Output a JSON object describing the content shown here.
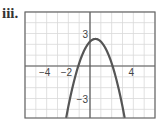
{
  "problem_label": "iii.",
  "chart_data": {
    "type": "line",
    "title": "",
    "xlabel": "",
    "ylabel": "",
    "xlim": [
      -6,
      6
    ],
    "ylim": [
      -4.8,
      5
    ],
    "grid": true,
    "grid_step": 1,
    "x_tick_labels": [
      {
        "value": -4,
        "label": "−4"
      },
      {
        "value": -2,
        "label": "−2"
      },
      {
        "value": 4,
        "label": "4"
      }
    ],
    "y_tick_labels": [
      {
        "value": 3,
        "label": "3"
      },
      {
        "value": -3,
        "label": "−3"
      }
    ],
    "series": [
      {
        "name": "parabola",
        "equation": "y = -(x - 0.5)^2 + 2.5",
        "vertex": [
          0.5,
          2.5
        ],
        "x_intercepts": [
          -1.08,
          2.08
        ],
        "y_intercept": 2.25,
        "opens": "down",
        "color": "#555555"
      }
    ]
  },
  "colors": {
    "grid": "#d9d9d9",
    "axis": "#555555",
    "frame": "#666666",
    "curve": "#555555"
  }
}
